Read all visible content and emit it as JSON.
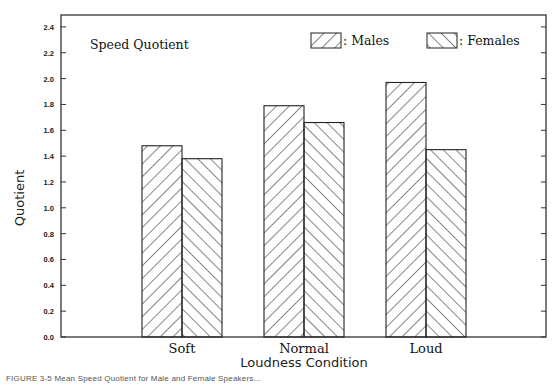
{
  "chart_data": {
    "type": "bar",
    "title": "Speed Quotient",
    "xlabel": "Loudness Condition",
    "ylabel": "Quotient",
    "categories": [
      "Soft",
      "Normal",
      "Loud"
    ],
    "series": [
      {
        "name": "Males",
        "pattern": "hatch-forward-diagonal",
        "values": [
          1.48,
          1.79,
          1.97
        ]
      },
      {
        "name": "Females",
        "pattern": "hatch-backward-diagonal",
        "values": [
          1.38,
          1.66,
          1.45
        ]
      }
    ],
    "ylim": [
      0.0,
      2.5
    ],
    "yticks": [
      "0.0",
      "0.2",
      "0.4",
      "0.6",
      "0.8",
      "1.0",
      "1.2",
      "1.4",
      "1.6",
      "1.8",
      "2.0",
      "2.2",
      "2.4"
    ],
    "grid": false,
    "legend": {
      "position": "top-right inside",
      "entries": [
        ": Males",
        ": Females"
      ]
    },
    "colors": {
      "bar_stroke": "#222222",
      "bar_fill": "#ffffff",
      "axis": "#333333"
    }
  },
  "caption": "FIGURE 3-5  Mean Speed Quotient for Male and Female Speakers..."
}
